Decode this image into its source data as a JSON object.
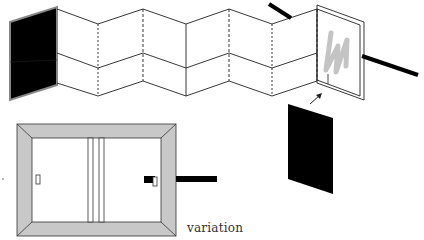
{
  "diagram": {
    "caption": "variation",
    "colors": {
      "line": "#222222",
      "fill_black": "#000000",
      "frame_gray": "#c8c8c8",
      "signature_gray": "#c4c4c4",
      "background": "#ffffff"
    },
    "elements": [
      "folded-accordion-panels",
      "black-end-panel-left",
      "double-frame-panel-right",
      "signature-mark",
      "rod-top",
      "rod-right",
      "arrow",
      "black-panel-floating",
      "sliding-door-frame",
      "door-handle-left",
      "door-handle-right",
      "rod-door"
    ]
  }
}
